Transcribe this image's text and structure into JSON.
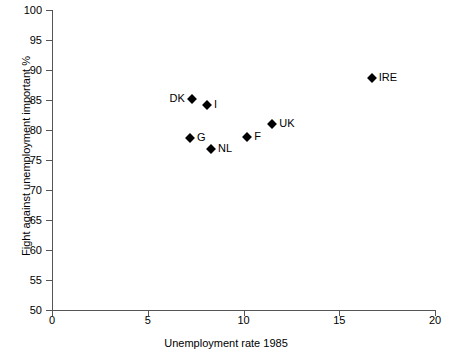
{
  "chart_data": {
    "type": "scatter",
    "title": "",
    "xlabel": "Unemployment rate 1985",
    "ylabel": "Fight against unemployment important %",
    "xlim": [
      0,
      20
    ],
    "ylim": [
      50,
      100
    ],
    "xticks": [
      0,
      5,
      10,
      15,
      20
    ],
    "yticks": [
      50,
      55,
      60,
      65,
      70,
      75,
      80,
      85,
      90,
      95,
      100
    ],
    "grid": false,
    "legend": "none",
    "marker": "filled-diamond",
    "marker_color": "#000000",
    "points": [
      {
        "label": "DK",
        "x": 7.3,
        "y": 85.2,
        "label_side": "left"
      },
      {
        "label": "I",
        "x": 8.1,
        "y": 84.2,
        "label_side": "right"
      },
      {
        "label": "G",
        "x": 7.2,
        "y": 78.7,
        "label_side": "right"
      },
      {
        "label": "NL",
        "x": 8.3,
        "y": 76.8,
        "label_side": "right"
      },
      {
        "label": "F",
        "x": 10.2,
        "y": 78.8,
        "label_side": "right"
      },
      {
        "label": "UK",
        "x": 11.5,
        "y": 81.0,
        "label_side": "right"
      },
      {
        "label": "IRE",
        "x": 16.7,
        "y": 88.7,
        "label_side": "right"
      }
    ]
  },
  "axes": {
    "x_title": "Unemployment rate 1985",
    "y_title": "Fight against unemployment important %",
    "x_tick_labels": [
      "0",
      "5",
      "10",
      "15",
      "20"
    ],
    "y_tick_labels": [
      "100",
      "95",
      "90",
      "85",
      "80",
      "75",
      "70",
      "65",
      "60",
      "55",
      "50"
    ]
  }
}
